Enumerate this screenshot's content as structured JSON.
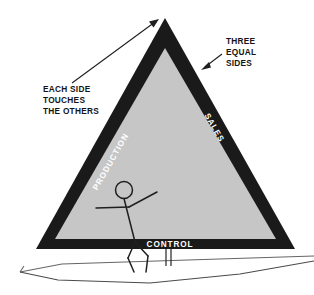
{
  "diagram": {
    "colors": {
      "triangle_border": "#1a1a1a",
      "triangle_fill": "#c6c6c6",
      "annotation_text": "#141414",
      "side_label_text": "#ffffff",
      "background": "#ffffff",
      "boat_outline": "#5a5a5a"
    },
    "triangle": {
      "sides": [
        {
          "id": "left",
          "label": "PRODUCTION"
        },
        {
          "id": "right",
          "label": "SALES"
        },
        {
          "id": "bottom",
          "label": "CONTROL"
        }
      ]
    },
    "annotations": [
      {
        "id": "each-side-touches",
        "lines": [
          "EACH SIDE",
          "TOUCHES",
          "THE OTHERS"
        ],
        "text": "EACH SIDE\nTOUCHES\nTHE OTHERS",
        "points_to": "apex"
      },
      {
        "id": "three-equal-sides",
        "lines": [
          "THREE",
          "EQUAL",
          "SIDES"
        ],
        "text": "THREE\nEQUAL\nSIDES",
        "points_to": "right-side"
      }
    ],
    "figures": [
      {
        "id": "sailor",
        "name": "stick-figure-sailor"
      },
      {
        "id": "boat",
        "name": "sailboat-hull"
      }
    ]
  }
}
